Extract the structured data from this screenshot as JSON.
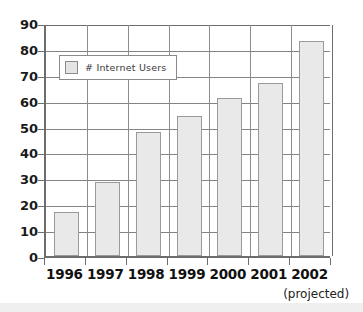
{
  "chart_data": {
    "type": "bar",
    "title": "",
    "xlabel": "",
    "ylabel": "",
    "categories": [
      "1996",
      "1997",
      "1998",
      "1999",
      "2000",
      "2001",
      "2002"
    ],
    "values": [
      17,
      28.5,
      48,
      54,
      61,
      67,
      83
    ],
    "series": [
      {
        "name": "# Internet Users",
        "values": [
          17,
          28.5,
          48,
          54,
          61,
          67,
          83
        ]
      }
    ],
    "ylim": [
      0,
      90
    ],
    "ytick_labels": [
      "0",
      "10",
      "20",
      "30",
      "40",
      "50",
      "60",
      "70",
      "80",
      "90"
    ],
    "ytick_values": [
      0,
      10,
      20,
      30,
      40,
      50,
      60,
      70,
      80,
      90
    ],
    "grid": true,
    "legend": {
      "position": "upper-left-inside",
      "entries": [
        {
          "label": "# Internet Users",
          "swatch_color": "#e4e4e4"
        }
      ]
    },
    "annotations": [
      {
        "text": "(projected)",
        "attached_to": "2002"
      }
    ],
    "colors": {
      "bar_fill": "#e9e9e9",
      "bar_border": "#9a9a9a",
      "gridline": "#848484",
      "axis": "#6d6d6d",
      "text": "#111111",
      "background": "#ffffff"
    }
  }
}
